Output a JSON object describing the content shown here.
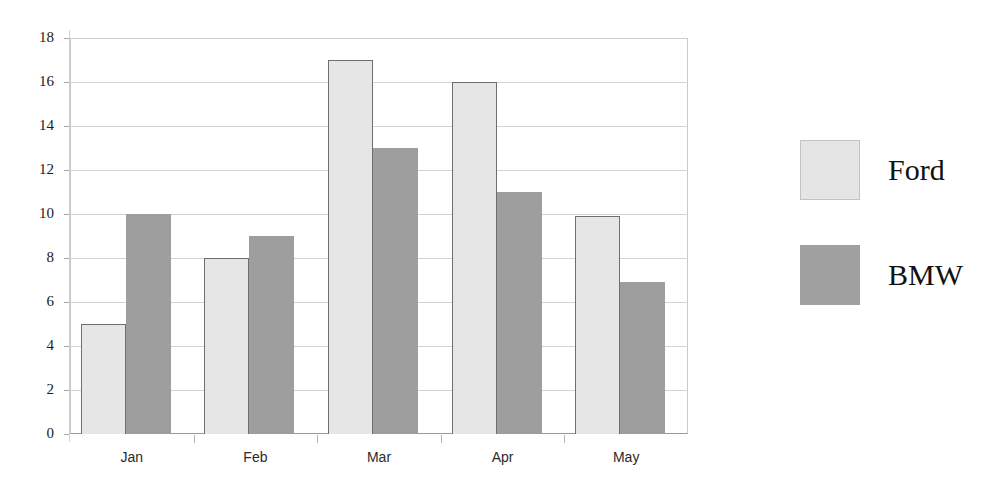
{
  "chart_data": {
    "type": "bar",
    "title": "",
    "subtitle": "",
    "xlabel": "",
    "ylabel": "",
    "categories": [
      "Jan",
      "Feb",
      "Mar",
      "Apr",
      "May"
    ],
    "series": [
      {
        "name": "Ford",
        "color": "#e6e6e6",
        "values": [
          5,
          8,
          17,
          16,
          9.9
        ]
      },
      {
        "name": "BMW",
        "color": "#9e9e9e",
        "values": [
          10,
          9,
          13,
          11,
          6.9
        ]
      }
    ],
    "ylim": [
      0,
      18
    ],
    "y_ticks": [
      0,
      2,
      4,
      6,
      8,
      10,
      12,
      14,
      16,
      18
    ],
    "y_tick_labels": [
      "0",
      "2",
      "4",
      "6",
      "8",
      "10",
      "12",
      "14",
      "16",
      "18"
    ],
    "grid": true,
    "grid_axis": "y",
    "legend_position": "right",
    "legend_entries": [
      "Ford",
      "BMW"
    ],
    "bar_group_mode": "grouped",
    "background_color": "#ffffff",
    "gridline_color": "#d2d2d2",
    "axis_color": "#9a9a9a"
  }
}
